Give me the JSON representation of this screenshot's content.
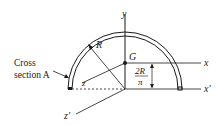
{
  "figure": {
    "labels": {
      "y_axis": "y",
      "x_axis": "x",
      "x_prime_axis": "x′",
      "z_prime_axis": "z′",
      "z_label": "z",
      "radius": "R",
      "centroid": "G",
      "cross_section_line1": "Cross",
      "cross_section_line2": "section A",
      "dim_numerator": "2R",
      "dim_denominator": "π"
    },
    "colors": {
      "line": "#1a1a1a",
      "background": "#ffffff"
    }
  }
}
